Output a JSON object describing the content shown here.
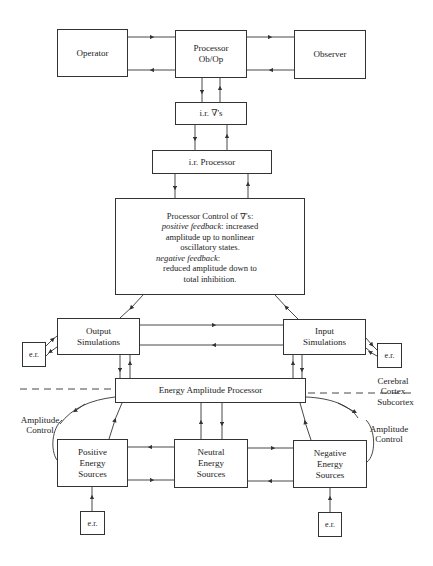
{
  "diagram": {
    "nodes": {
      "operator": {
        "label": "Operator"
      },
      "processor": {
        "line1": "Processor",
        "line2": "Ob/Op"
      },
      "observer": {
        "label": "Observer"
      },
      "ir_gradients": {
        "label": "i.r. ∇'s"
      },
      "ir_processor": {
        "label": "i.r. Processor"
      },
      "processor_control": {
        "title": "Processor Control of ∇'s:",
        "positive_label": "positive feedback",
        "positive_text": ": increased",
        "positive_line2": "amplitude up to nonlinear",
        "positive_line3": "oscillatory states.",
        "negative_label": "negative feedback",
        "negative_text": ":",
        "negative_line2": "reduced amplitude down to",
        "negative_line3": "total inhibition."
      },
      "output_simulations": {
        "line1": "Output",
        "line2": "Simulations"
      },
      "input_simulations": {
        "line1": "Input",
        "line2": "Simulations"
      },
      "energy_amplitude_processor": {
        "label": "Energy Amplitude Processor"
      },
      "positive_sources": {
        "line1": "Positive",
        "line2": "Energy",
        "line3": "Sources"
      },
      "neutral_sources": {
        "line1": "Neutral",
        "line2": "Energy",
        "line3": "Sources"
      },
      "negative_sources": {
        "line1": "Negative",
        "line2": "Energy",
        "line3": "Sources"
      },
      "er_left": {
        "label": "e.r."
      },
      "er_right": {
        "label": "e.r."
      },
      "er_bottom_left": {
        "label": "e.r."
      },
      "er_bottom_right": {
        "label": "e.r."
      }
    },
    "annotations": {
      "cerebral_line1": "Cerebral",
      "cerebral_line2": "Cortex",
      "subcortex": "Subcortex",
      "amp_control_left_line1": "Amplitude",
      "amp_control_left_line2": "Control",
      "amp_control_right_line1": "Amplitude",
      "amp_control_right_line2": "Control"
    },
    "colors": {
      "stroke": "#333333",
      "background": "#ffffff"
    }
  }
}
